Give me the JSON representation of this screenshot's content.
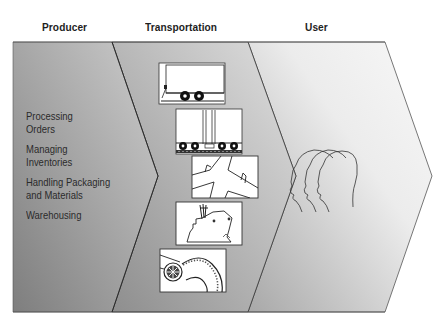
{
  "headers": {
    "producer": "Producer",
    "transportation": "Transportation",
    "user": "User"
  },
  "producer": {
    "activities": [
      {
        "line1": "Processing",
        "line2": "Orders"
      },
      {
        "line1": "Managing",
        "line2": "Inventories"
      },
      {
        "line1": "Handling Packaging",
        "line2": "and Materials"
      },
      {
        "line1": "Warehousing",
        "line2": ""
      }
    ]
  },
  "transportation": {
    "modes": [
      "truck-trailer",
      "rail-car",
      "airplane",
      "ship",
      "pipeline"
    ]
  },
  "user": {
    "icon": "three-heads-profile"
  },
  "colors": {
    "producer_fill_dark": "#8a8a8a",
    "producer_fill_light": "#c8c8c8",
    "transport_fill_dark": "#9e9e9e",
    "transport_fill_light": "#dcdcdc",
    "user_fill_dark": "#b4b4b4",
    "user_fill_light": "#f2f2f2",
    "stroke": "#333333",
    "text": "#222222"
  }
}
